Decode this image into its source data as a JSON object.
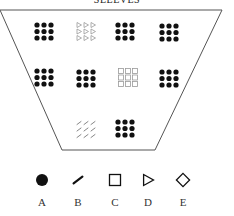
{
  "title": "SLEEVES",
  "container": {
    "shape": "inverted-trapezoid",
    "points": [
      [
        0,
        10
      ],
      [
        222,
        10
      ],
      [
        155,
        150
      ],
      [
        62,
        150
      ]
    ],
    "stroke": "#555555"
  },
  "groups": [
    {
      "id": "r1c1",
      "type": "dot",
      "x": 37,
      "y": 25,
      "color": "#111111"
    },
    {
      "id": "r1c2",
      "type": "triangle",
      "x": 79,
      "y": 25,
      "color": "#999999"
    },
    {
      "id": "r1c3",
      "type": "dot",
      "x": 118,
      "y": 25,
      "color": "#111111"
    },
    {
      "id": "r1c4",
      "type": "dot",
      "x": 162,
      "y": 26,
      "color": "#111111"
    },
    {
      "id": "r2c1",
      "type": "dot",
      "x": 37,
      "y": 71,
      "color": "#111111"
    },
    {
      "id": "r2c2",
      "type": "dot",
      "x": 79,
      "y": 72,
      "color": "#111111"
    },
    {
      "id": "r2c3",
      "type": "square",
      "x": 121,
      "y": 71,
      "color": "#999999"
    },
    {
      "id": "r2c4",
      "type": "dot",
      "x": 162,
      "y": 72,
      "color": "#111111"
    },
    {
      "id": "r3c2",
      "type": "slash",
      "x": 79,
      "y": 123,
      "color": "#777777"
    },
    {
      "id": "r3c3",
      "type": "dot",
      "x": 118,
      "y": 122,
      "color": "#111111"
    }
  ],
  "legend": [
    {
      "type": "dot",
      "label": "A",
      "x": 42
    },
    {
      "type": "slash",
      "label": "B",
      "x": 78
    },
    {
      "type": "square",
      "label": "C",
      "x": 115
    },
    {
      "type": "triangle",
      "label": "D",
      "x": 148
    },
    {
      "type": "diamond",
      "label": "E",
      "x": 183
    }
  ]
}
